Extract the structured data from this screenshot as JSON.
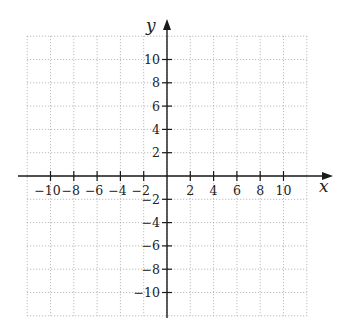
{
  "chart_data": {
    "type": "coordinate-grid",
    "title": "",
    "xlabel": "x",
    "ylabel": "y",
    "xlim": [
      -12,
      12
    ],
    "ylim": [
      -12,
      12
    ],
    "grid": true,
    "grid_style": "dotted",
    "grid_step": 2,
    "x_ticks": [
      -10,
      -8,
      -6,
      -4,
      -2,
      2,
      4,
      6,
      8,
      10
    ],
    "y_ticks": [
      -10,
      -8,
      -6,
      -4,
      -2,
      2,
      4,
      6,
      8,
      10
    ],
    "x_tick_labels": [
      "−10",
      "−8",
      "−6",
      "−4",
      "−2",
      "2",
      "4",
      "6",
      "8",
      "10"
    ],
    "y_tick_labels": [
      "−10",
      "−8",
      "−6",
      "−4",
      "−2",
      "2",
      "4",
      "6",
      "8",
      "10"
    ],
    "series": []
  },
  "layout": {
    "origin_px": [
      167,
      176
    ],
    "unit_px": 11.65,
    "axis_color": "#1a1a1a",
    "grid_color": "#9a9a9a"
  }
}
